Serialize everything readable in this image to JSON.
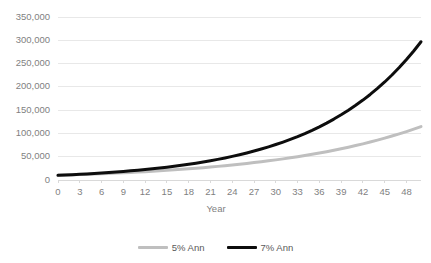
{
  "chart_data": {
    "type": "line",
    "title": "",
    "xlabel": "Year",
    "ylabel": "",
    "xlim": [
      0,
      50
    ],
    "ylim": [
      0,
      350000
    ],
    "grid": true,
    "legend_position": "bottom",
    "x_tick_labels": [
      "0",
      "3",
      "6",
      "9",
      "12",
      "15",
      "18",
      "21",
      "24",
      "27",
      "30",
      "33",
      "36",
      "39",
      "42",
      "45",
      "48"
    ],
    "x_tick_values": [
      0,
      3,
      6,
      9,
      12,
      15,
      18,
      21,
      24,
      27,
      30,
      33,
      36,
      39,
      42,
      45,
      48
    ],
    "y_tick_labels": [
      "0",
      "50,000",
      "100,000",
      "150,000",
      "200,000",
      "250,000",
      "300,000",
      "350,000"
    ],
    "y_tick_values": [
      0,
      50000,
      100000,
      150000,
      200000,
      250000,
      300000,
      350000
    ],
    "x": [
      0,
      1,
      2,
      3,
      4,
      5,
      6,
      7,
      8,
      9,
      10,
      11,
      12,
      13,
      14,
      15,
      16,
      17,
      18,
      19,
      20,
      21,
      22,
      23,
      24,
      25,
      26,
      27,
      28,
      29,
      30,
      31,
      32,
      33,
      34,
      35,
      36,
      37,
      38,
      39,
      40,
      41,
      42,
      43,
      44,
      45,
      46,
      47,
      48,
      49,
      50
    ],
    "series": [
      {
        "name": "5% Ann",
        "color": "#bfbfbf",
        "line_width": 3,
        "values": [
          10000,
          10500,
          11025,
          11576,
          12155,
          12763,
          13401,
          14071,
          14775,
          15513,
          16289,
          17103,
          17959,
          18856,
          19799,
          20789,
          21829,
          22920,
          24066,
          25270,
          26533,
          27860,
          29253,
          30715,
          32251,
          33864,
          35557,
          37335,
          39201,
          41161,
          43219,
          45380,
          47649,
          50032,
          52533,
          55160,
          57918,
          60814,
          63855,
          67048,
          70400,
          73920,
          77616,
          81497,
          85572,
          89850,
          94343,
          99060,
          104013,
          109214,
          114674
        ]
      },
      {
        "name": "7% Ann",
        "color": "#0d0d0d",
        "line_width": 3,
        "values": [
          10000,
          10700,
          11449,
          12250,
          13108,
          14026,
          15007,
          16058,
          17182,
          18385,
          19672,
          21049,
          22522,
          24098,
          25785,
          27590,
          29522,
          31588,
          33799,
          36165,
          38697,
          41406,
          44304,
          47405,
          50724,
          54274,
          58074,
          62139,
          66488,
          71143,
          76123,
          81451,
          87153,
          93253,
          99781,
          106766,
          114241,
          122242,
          130807,
          139978,
          149800,
          160321,
          171594,
          183676,
          196630,
          210525,
          225434,
          241437,
          258619,
          277073,
          296898
        ]
      }
    ]
  },
  "axis_title": "Year",
  "legend": {
    "items": [
      {
        "label": "5% Ann",
        "color": "#bfbfbf"
      },
      {
        "label": "7% Ann",
        "color": "#0d0d0d"
      }
    ]
  }
}
